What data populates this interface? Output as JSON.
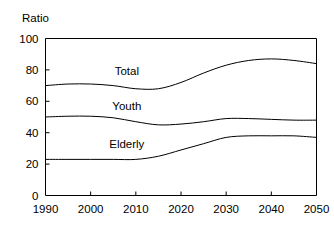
{
  "chart_data": {
    "type": "line",
    "title": "",
    "subtitle": "",
    "xlabel": "",
    "ylabel": "Ratio",
    "xlim": [
      1990,
      2050
    ],
    "ylim": [
      0,
      100
    ],
    "grid": false,
    "legend_position": "inline-above-curve",
    "x_ticks": [
      "1990",
      "2000",
      "2010",
      "2020",
      "2030",
      "2040",
      "2050"
    ],
    "x_tick_values": [
      1990,
      2000,
      2010,
      2020,
      2030,
      2040,
      2050
    ],
    "y_ticks": [
      "0",
      "20",
      "40",
      "60",
      "80",
      "100"
    ],
    "y_tick_values": [
      0,
      20,
      40,
      60,
      80,
      100
    ],
    "x": [
      1990,
      1995,
      2000,
      2005,
      2010,
      2015,
      2020,
      2025,
      2030,
      2035,
      2040,
      2045,
      2050
    ],
    "series": [
      {
        "name": "Total",
        "label": "Total",
        "label_x": 2008,
        "label_y": 79,
        "values": [
          70,
          71,
          71,
          70,
          68,
          68,
          72,
          78,
          83,
          86,
          87,
          86,
          84
        ]
      },
      {
        "name": "Youth",
        "label": "Youth",
        "label_x": 2008,
        "label_y": 57,
        "values": [
          50,
          50.5,
          50.5,
          49.5,
          47,
          45,
          45.5,
          47,
          49,
          49,
          48.5,
          48,
          48
        ]
      },
      {
        "name": "Elderly",
        "label": "Elderly",
        "label_x": 2008,
        "label_y": 33,
        "values": [
          23,
          23,
          23,
          23,
          23,
          25,
          29,
          33,
          37,
          38,
          38,
          38,
          37
        ]
      }
    ]
  },
  "chart_colors": {
    "line": "#000000",
    "axis": "#000000",
    "background": "#ffffff",
    "text": "#000000"
  }
}
